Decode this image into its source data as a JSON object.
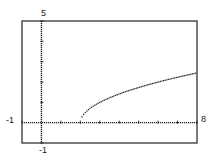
{
  "chart_data": {
    "type": "line",
    "title": "",
    "function": "y = sqrt(x - 2)",
    "xlabel": "",
    "ylabel": "",
    "xlim": [
      -1,
      8
    ],
    "ylim": [
      -1,
      5
    ],
    "xscale": 1,
    "yscale": 1,
    "grid": false,
    "window_labels": {
      "xmin": "-1",
      "xmax": "8",
      "ymin": "-1",
      "ymax": "5"
    },
    "series": [
      {
        "name": "y = sqrt(x - 2)",
        "style": "dotted",
        "x": [
          2,
          2.5,
          3,
          3.5,
          4,
          4.5,
          5,
          5.5,
          6,
          6.5,
          7,
          7.5,
          8
        ],
        "y": [
          0,
          0.71,
          1,
          1.22,
          1.41,
          1.58,
          1.73,
          1.87,
          2,
          2.12,
          2.24,
          2.35,
          2.45
        ]
      }
    ],
    "colors": {
      "axis": "#222222",
      "curve": "#333333",
      "frame": "#333333"
    }
  }
}
